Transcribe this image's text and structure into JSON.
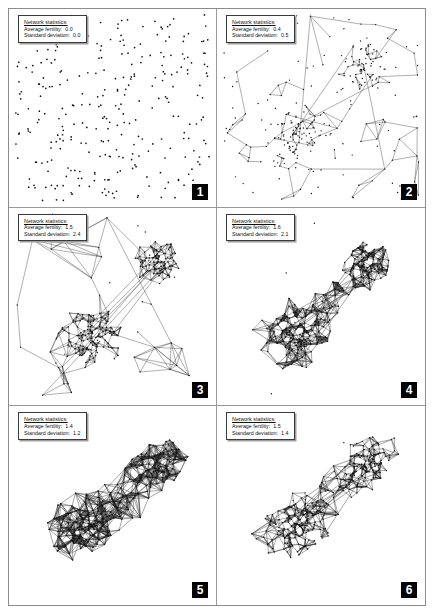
{
  "figure": {
    "title": "",
    "panel_count": 6,
    "layout": {
      "columns": 2,
      "rows": 3
    },
    "background_color": "#ffffff",
    "node_color": "#111111",
    "edge_color": "#2b2b2b",
    "badge_background": "#000000",
    "badge_text_color": "#ffffff"
  },
  "labels": {
    "stats_title": "Network statistics:",
    "avg_fertility_label": "Average fertility:",
    "std_deviation_label": "Standard deviation:"
  },
  "panels": [
    {
      "number": "1",
      "stats": {
        "average_fertility": "0.0",
        "standard_deviation": "0.0"
      },
      "description": "dispersed unconnected nodes, no edges"
    },
    {
      "number": "2",
      "stats": {
        "average_fertility": "0.4",
        "standard_deviation": "0.5"
      },
      "description": "two sparse clusters beginning to link"
    },
    {
      "number": "3",
      "stats": {
        "average_fertility": "1.5",
        "standard_deviation": "2.4"
      },
      "description": "large lower-left cluster and small upper-right cluster"
    },
    {
      "number": "4",
      "stats": {
        "average_fertility": "1.6",
        "standard_deviation": "2.1"
      },
      "description": "dense merged diagonal network"
    },
    {
      "number": "5",
      "stats": {
        "average_fertility": "1.4",
        "standard_deviation": "1.2"
      },
      "description": "very dense saturated diagonal network"
    },
    {
      "number": "6",
      "stats": {
        "average_fertility": "1.5",
        "standard_deviation": "1.4"
      },
      "description": "dense elongated network with open interior regions"
    }
  ],
  "chart_data": {
    "type": "scatter",
    "xlabel": "",
    "ylabel": "",
    "series": [
      {
        "name": "Stage 1",
        "average_fertility": 0.0,
        "standard_deviation": 0.0
      },
      {
        "name": "Stage 2",
        "average_fertility": 0.4,
        "standard_deviation": 0.5
      },
      {
        "name": "Stage 3",
        "average_fertility": 1.5,
        "standard_deviation": 2.4
      },
      {
        "name": "Stage 4",
        "average_fertility": 1.6,
        "standard_deviation": 2.1
      },
      {
        "name": "Stage 5",
        "average_fertility": 1.4,
        "standard_deviation": 1.2
      },
      {
        "name": "Stage 6",
        "average_fertility": 1.5,
        "standard_deviation": 1.4
      }
    ],
    "categories": [
      "1",
      "2",
      "3",
      "4",
      "5",
      "6"
    ],
    "values": [
      0.0,
      0.4,
      1.5,
      1.6,
      1.4,
      1.5
    ]
  }
}
